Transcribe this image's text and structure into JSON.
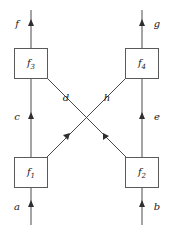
{
  "diagram": {
    "kind": "string-diagram",
    "caption": "",
    "boxes": [
      {
        "id": "f3",
        "base": "f",
        "sub": "3",
        "x": 31,
        "y": 63,
        "w": 33,
        "h": 30
      },
      {
        "id": "f4",
        "base": "f",
        "sub": "4",
        "x": 142,
        "y": 63,
        "w": 33,
        "h": 30
      },
      {
        "id": "f1",
        "base": "f",
        "sub": "1",
        "x": 31,
        "y": 172,
        "w": 33,
        "h": 30
      },
      {
        "id": "f2",
        "base": "f",
        "sub": "2",
        "x": 142,
        "y": 172,
        "w": 33,
        "h": 30
      }
    ],
    "wire_labels": {
      "top_left": "f",
      "top_right": "g",
      "bottom_left": "a",
      "bottom_right": "b",
      "middle_left": "c",
      "middle_right": "e",
      "diagonal_left": "d",
      "diagonal_right": "h"
    },
    "colors": {
      "line": "#4a4a4a",
      "box_stroke": "#5a5a5a",
      "box_fill": "#ffffff",
      "arrow": "#2e2e2e",
      "text": "#1a1a1a",
      "background": "#ffffff"
    }
  }
}
